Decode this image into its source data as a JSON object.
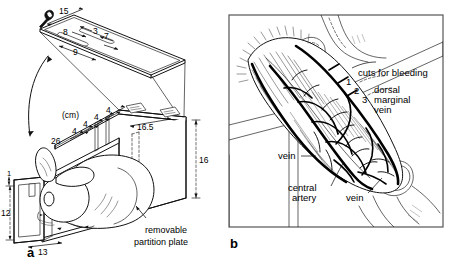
{
  "figure": {
    "caption_unit": "(cm)",
    "panels": [
      {
        "letter": "a",
        "title": "rabbit restraining box"
      },
      {
        "letter": "b",
        "title": "rabbit ear vasculature"
      }
    ]
  },
  "panel_a": {
    "letter": "a",
    "unit_label": "(cm)",
    "annotation": {
      "partition_line1": "removable",
      "partition_line2": "partition plate"
    },
    "dimensions": {
      "lid_length": "15",
      "lid_slot_offset": "8",
      "lid_edge": "3",
      "lid_side": "7",
      "lid_slot_length": "9",
      "body_length": "26",
      "rib_spacing_1": "4",
      "rib_spacing_2": "4",
      "rib_spacing_3": "4",
      "rib_spacing_4": "4",
      "top_width": "16.5",
      "height_right": "16",
      "front_top_margin": "1",
      "front_height": "12",
      "front_width": "13"
    },
    "dimension_list": [
      {
        "name": "lid-length",
        "value": "15"
      },
      {
        "name": "lid-slot-offset",
        "value": "8"
      },
      {
        "name": "lid-edge",
        "value": "3"
      },
      {
        "name": "lid-side",
        "value": "7"
      },
      {
        "name": "lid-slot-length",
        "value": "9"
      },
      {
        "name": "body-length",
        "value": "26"
      },
      {
        "name": "rib-spacing",
        "value": "4"
      },
      {
        "name": "top-width",
        "value": "16.5"
      },
      {
        "name": "height-right",
        "value": "16"
      },
      {
        "name": "front-top-margin",
        "value": "1"
      },
      {
        "name": "front-height",
        "value": "12"
      },
      {
        "name": "front-width",
        "value": "13"
      }
    ]
  },
  "panel_b": {
    "letter": "b",
    "labels": {
      "cuts_for_bleeding": "cuts for bleeding",
      "dorsal_marginal_vein_line1": "dorsal",
      "dorsal_marginal_vein_line2": "marginal",
      "dorsal_marginal_vein_line3": "vein",
      "central_artery_line1": "central",
      "central_artery_line2": "artery",
      "vein_left": "vein",
      "vein_lower": "vein"
    },
    "cut_numbers": [
      "1",
      "2",
      "3"
    ]
  },
  "colors": {
    "ink": "#000000",
    "line": "#111111",
    "hatch": "#4a4a4a",
    "frame": "#555555",
    "background": "#ffffff"
  }
}
